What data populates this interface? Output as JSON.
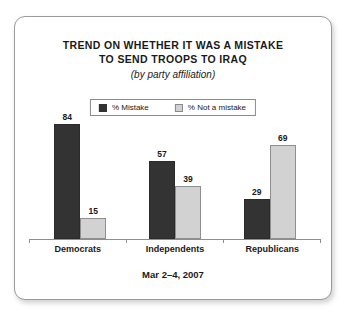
{
  "chart_data": {
    "type": "bar",
    "title": "TREND ON WHETHER IT WAS A MISTAKE TO SEND TROOPS TO IRAQ",
    "title_lines": [
      "TREND ON WHETHER IT WAS A MISTAKE",
      "TO SEND TROOPS TO IRAQ"
    ],
    "subtitle": "(by party affiliation)",
    "categories": [
      "Democrats",
      "Independents",
      "Republicans"
    ],
    "series": [
      {
        "name": "% Mistake",
        "values": [
          84,
          57,
          29
        ],
        "color": "#333333"
      },
      {
        "name": "% Not a mistake",
        "values": [
          15,
          39,
          69
        ],
        "color": "#d2d2d2"
      }
    ],
    "xlabel": "",
    "ylabel": "",
    "ylim": [
      0,
      100
    ],
    "grid": false,
    "legend_position": "top-center",
    "annotation": "Mar 2-4, 2007"
  },
  "legend": {
    "items": [
      {
        "label": "% Mistake",
        "swatch": "dark"
      },
      {
        "label": "% Not a mistake",
        "swatch": "light"
      }
    ]
  },
  "footer": {
    "date": "Mar 2–4, 2007"
  },
  "colors": {
    "dark_bar": "#333333",
    "light_bar": "#d2d2d2",
    "axis": "#8f8f8f",
    "text": "#1a1a1a",
    "card_border": "#9a9a9a",
    "background": "#ffffff"
  }
}
